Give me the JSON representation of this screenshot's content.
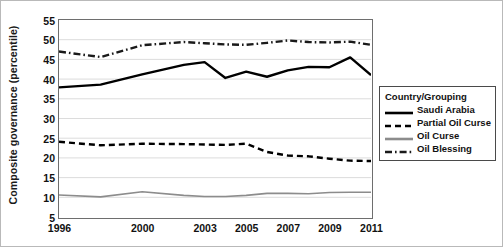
{
  "chart_data": {
    "type": "line",
    "title": "",
    "xlabel": "",
    "ylabel": "Composite governance (percentile)",
    "ylim": [
      5,
      55
    ],
    "yticks": [
      5,
      10,
      15,
      20,
      25,
      30,
      35,
      40,
      45,
      50,
      55
    ],
    "xlim": [
      1996,
      2011
    ],
    "xticks": [
      1996,
      2000,
      2003,
      2005,
      2007,
      2009,
      2011
    ],
    "xticklabels": [
      "1996",
      "2000",
      "2003",
      "2005",
      "2007",
      "2009",
      "2011"
    ],
    "grid": "horizontal",
    "legend_position": "right",
    "legend_title": "Country/Grouping",
    "x": [
      1996,
      1998,
      2000,
      2002,
      2003,
      2004,
      2005,
      2006,
      2007,
      2008,
      2009,
      2010,
      2011
    ],
    "series": [
      {
        "name": "Saudi Arabia",
        "style": "solid",
        "color": "#000000",
        "values": [
          37.9,
          38.6,
          41.2,
          43.6,
          44.3,
          40.3,
          41.9,
          40.6,
          42.2,
          43.1,
          43.0,
          45.5,
          41.0
        ]
      },
      {
        "name": "Partial Oil Curse",
        "style": "dashed",
        "color": "#000000",
        "values": [
          24.1,
          23.2,
          23.6,
          23.5,
          23.4,
          23.3,
          23.6,
          21.5,
          20.6,
          20.4,
          19.8,
          19.3,
          19.2
        ]
      },
      {
        "name": "Oil Curse",
        "style": "solid",
        "color": "#8c8c8c",
        "values": [
          10.6,
          10.1,
          11.4,
          10.5,
          10.2,
          10.2,
          10.5,
          11.0,
          11.0,
          10.9,
          11.2,
          11.3,
          11.3
        ]
      },
      {
        "name": "Oil Blessing",
        "style": "dashdot",
        "color": "#1a1a1a",
        "values": [
          47.0,
          45.6,
          48.6,
          49.4,
          49.1,
          48.8,
          48.7,
          49.2,
          49.8,
          49.4,
          49.3,
          49.5,
          48.7
        ]
      }
    ]
  },
  "legend": {
    "title": "Country/Grouping",
    "items": [
      {
        "label": "Saudi Arabia",
        "swatch": "solid-black-line-icon"
      },
      {
        "label": "Partial Oil Curse",
        "swatch": "dashed-black-line-icon"
      },
      {
        "label": "Oil Curse",
        "swatch": "solid-gray-line-icon"
      },
      {
        "label": "Oil Blessing",
        "swatch": "dash-dot-black-line-icon"
      }
    ]
  },
  "axes": {
    "y_title": "Composite governance (percentile)",
    "y_labels": [
      "55",
      "50",
      "45",
      "40",
      "35",
      "30",
      "25",
      "20",
      "15",
      "10",
      "5"
    ],
    "x_labels": [
      "1996",
      "2000",
      "2003",
      "2005",
      "2007",
      "2009",
      "2011"
    ]
  }
}
